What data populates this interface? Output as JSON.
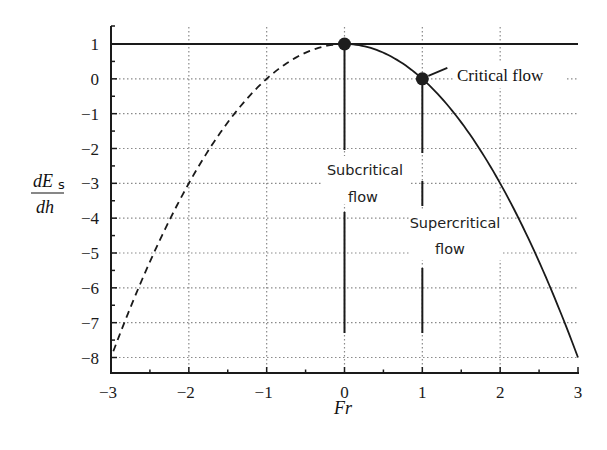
{
  "chart_data": {
    "type": "line",
    "title": "",
    "xlabel": "Fr",
    "ylabel": "dEs/dh",
    "ylabel_parts": {
      "numerator": "dE",
      "subscript": "s",
      "denominator": "dh"
    },
    "xlim": [
      -3,
      3
    ],
    "ylim": [
      -8,
      1
    ],
    "x_ticks": [
      -3,
      -2,
      -1,
      0,
      1,
      2,
      3
    ],
    "x_tick_labels": [
      "−3",
      "−2",
      "−1",
      "0",
      "1",
      "2",
      "3"
    ],
    "y_ticks": [
      1,
      0,
      -1,
      -2,
      -3,
      -4,
      -5,
      -6,
      -7,
      -8
    ],
    "y_tick_labels": [
      "1",
      "0",
      "−1",
      "−2",
      "−3",
      "−4",
      "−5",
      "−6",
      "−7",
      "−8"
    ],
    "grid": true,
    "grid_style": "dotted",
    "legend": null,
    "series": [
      {
        "name": "dEs/dh = 1 - Fr^2 (Fr < 0)",
        "style": "dashed",
        "x": [
          -3,
          -2.5,
          -2,
          -1.5,
          -1,
          -0.5,
          0
        ],
        "y": [
          -8,
          -5.25,
          -3,
          -1.25,
          0,
          0.75,
          1
        ]
      },
      {
        "name": "dEs/dh = 1 - Fr^2 (Fr >= 0)",
        "style": "solid",
        "x": [
          0,
          0.5,
          1,
          1.5,
          2,
          2.5,
          3
        ],
        "y": [
          1,
          0.75,
          0,
          -1.25,
          -3,
          -5.25,
          -8
        ]
      },
      {
        "name": "reference line y = 1",
        "style": "solid",
        "x": [
          -3,
          3
        ],
        "y": [
          1,
          1
        ]
      }
    ],
    "points": [
      {
        "x": 0,
        "y": 1,
        "label": ""
      },
      {
        "x": 1,
        "y": 0,
        "label": "Critical flow"
      }
    ],
    "annotations": [
      {
        "text": "Critical flow",
        "x": 1,
        "y": 0
      },
      {
        "text": "Subcritical flow",
        "lines": [
          "Subcritical",
          "flow"
        ],
        "x": 0,
        "region": "between Fr=0 and Fr=1"
      },
      {
        "text": "Supercritical flow",
        "lines": [
          "Supercritical",
          "flow"
        ],
        "x": 1,
        "region": "Fr > 1"
      }
    ]
  },
  "labels": {
    "critical": "Critical flow",
    "subcritical_1": "Subcritical",
    "subcritical_2": "flow",
    "supercritical_1": "Supercritical",
    "supercritical_2": "flow",
    "xlabel": "Fr",
    "ylabel_num": "dE",
    "ylabel_sub": "s",
    "ylabel_den": "dh"
  },
  "colors": {
    "line": "#1a1a1a",
    "grid": "#8a8a8a",
    "background": "#ffffff",
    "marker": "#1e1e1e"
  }
}
